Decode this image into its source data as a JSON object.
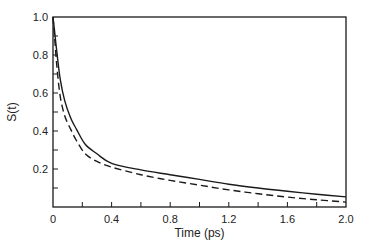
{
  "chart_data": {
    "type": "line",
    "title": "",
    "xlabel": "Time (ps)",
    "ylabel": "S(t)",
    "xlim": [
      0,
      2.0
    ],
    "ylim": [
      0,
      1.0
    ],
    "grid": false,
    "legend": null,
    "x_ticks": [
      {
        "value": 0,
        "label": "0"
      },
      {
        "value": 0.4,
        "label": "0.4"
      },
      {
        "value": 0.8,
        "label": "0.8"
      },
      {
        "value": 1.2,
        "label": "1.2"
      },
      {
        "value": 1.6,
        "label": "1.6"
      },
      {
        "value": 2.0,
        "label": "2.0"
      }
    ],
    "x_minor_ticks": [
      0.2,
      0.6,
      1.0,
      1.4,
      1.8
    ],
    "y_ticks": [
      {
        "value": 0.2,
        "label": "0.2"
      },
      {
        "value": 0.4,
        "label": "0.4"
      },
      {
        "value": 0.6,
        "label": "0.6"
      },
      {
        "value": 0.8,
        "label": "0.8"
      },
      {
        "value": 1.0,
        "label": "1.0"
      }
    ],
    "y_minor_ticks": [
      0.1,
      0.3,
      0.5,
      0.7,
      0.9
    ],
    "series": [
      {
        "name": "solid",
        "style": "solid",
        "x": [
          0,
          0.01,
          0.02,
          0.03,
          0.05,
          0.08,
          0.12,
          0.16,
          0.22,
          0.3,
          0.4,
          0.6,
          0.8,
          1.0,
          1.2,
          1.4,
          1.6,
          1.8,
          2.0
        ],
        "y": [
          1.0,
          0.93,
          0.86,
          0.79,
          0.67,
          0.56,
          0.47,
          0.41,
          0.33,
          0.28,
          0.23,
          0.195,
          0.17,
          0.145,
          0.12,
          0.1,
          0.083,
          0.067,
          0.053
        ]
      },
      {
        "name": "dashed",
        "style": "dashed",
        "x": [
          0,
          0.01,
          0.02,
          0.03,
          0.05,
          0.08,
          0.12,
          0.16,
          0.22,
          0.3,
          0.4,
          0.6,
          0.8,
          1.0,
          1.2,
          1.4,
          1.6,
          1.8,
          2.0
        ],
        "y": [
          1.0,
          0.9,
          0.8,
          0.71,
          0.58,
          0.48,
          0.41,
          0.35,
          0.28,
          0.24,
          0.21,
          0.17,
          0.14,
          0.115,
          0.09,
          0.07,
          0.052,
          0.038,
          0.026
        ]
      }
    ]
  },
  "layout": {
    "plot_left": 53,
    "plot_right": 346,
    "plot_top": 17,
    "plot_bottom": 207,
    "line_color": "#1a1a1a"
  }
}
